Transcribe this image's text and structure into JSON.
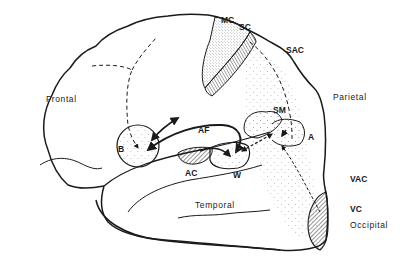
{
  "diagram": {
    "lobes": [
      {
        "id": "frontal",
        "label": "Frontal"
      },
      {
        "id": "parietal",
        "label": "Parietal"
      },
      {
        "id": "temporal",
        "label": "Temporal"
      },
      {
        "id": "occipital",
        "label": "Occipital"
      }
    ],
    "areas": [
      {
        "id": "mc",
        "label": "MC"
      },
      {
        "id": "sc",
        "label": "SC"
      },
      {
        "id": "sac",
        "label": "SAC"
      },
      {
        "id": "sm",
        "label": "SM"
      },
      {
        "id": "a",
        "label": "A"
      },
      {
        "id": "af",
        "label": "AF"
      },
      {
        "id": "b",
        "label": "B"
      },
      {
        "id": "ac",
        "label": "AC"
      },
      {
        "id": "w",
        "label": "W"
      },
      {
        "id": "vac",
        "label": "VAC"
      },
      {
        "id": "vc",
        "label": "VC"
      }
    ],
    "colors": {
      "line": "#1a1a1a",
      "background": "#ffffff",
      "stipple": "#9a9a9a"
    }
  }
}
